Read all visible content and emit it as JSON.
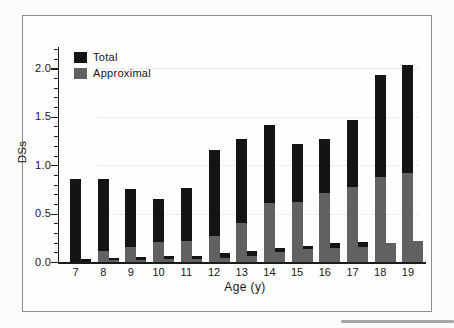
{
  "chart_data": {
    "type": "bar",
    "title": "",
    "xlabel": "Age (y)",
    "ylabel": "DSs",
    "ylim": [
      0,
      2.2
    ],
    "yticks": [
      0,
      0.5,
      1,
      1.5,
      2
    ],
    "ytick_labels": [
      "0.0",
      "0.5",
      "1.0",
      "1.5",
      "2.0"
    ],
    "minor_tick_step": 0.1,
    "grid": "faint dotted horizontal lines at major ticks",
    "legend_position": "top-left inside plot",
    "legend": [
      {
        "label": "Total",
        "color": "#141414"
      },
      {
        "label": "Approximal",
        "color": "#616161"
      }
    ],
    "bar_layout": "each age group has a tall left bar and a short right bar; in both, the gray Approximal value overlays the lower part of the black Total bar",
    "categories": [
      "7",
      "8",
      "9",
      "10",
      "11",
      "12",
      "13",
      "14",
      "15",
      "16",
      "17",
      "18",
      "19"
    ],
    "series": [
      {
        "name": "Total (left bar)",
        "color": "#141414",
        "values": [
          0.86,
          0.86,
          0.75,
          0.65,
          0.76,
          1.16,
          1.27,
          1.42,
          1.22,
          1.27,
          1.47,
          1.93,
          2.03
        ]
      },
      {
        "name": "Approximal (left bar)",
        "color": "#616161",
        "values": [
          0,
          0.11,
          0.16,
          0.21,
          0.22,
          0.27,
          0.4,
          0.61,
          0.62,
          0.71,
          0.77,
          0.88,
          0.92
        ]
      },
      {
        "name": "Total (right small bar)",
        "color": "#141414",
        "values": [
          0.03,
          0.04,
          0.05,
          0.06,
          0.06,
          0.09,
          0.11,
          0.14,
          0.17,
          0.2,
          0.21,
          0.2,
          0.22
        ]
      },
      {
        "name": "Approximal (right small bar)",
        "color": "#616161",
        "values": [
          0,
          0.02,
          0.02,
          0.03,
          0.03,
          0.04,
          0.06,
          0.1,
          0.13,
          0.14,
          0.16,
          0.2,
          0.22
        ]
      }
    ]
  }
}
